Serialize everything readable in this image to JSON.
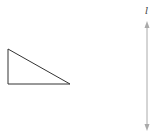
{
  "diagram": {
    "line_label": "l",
    "colors": {
      "triangle_stroke": "#333333",
      "line_stroke": "#aaaaaa",
      "label": "#444444"
    },
    "triangle": {
      "vertices": [
        [
          8,
          49
        ],
        [
          8,
          84
        ],
        [
          70,
          84
        ]
      ]
    },
    "line": {
      "x": 147,
      "y1": 22,
      "y2": 130,
      "arrows": "both"
    }
  }
}
